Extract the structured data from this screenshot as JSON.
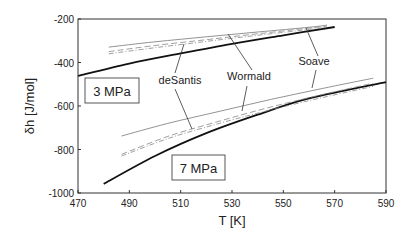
{
  "chart_data": {
    "type": "line",
    "title": "",
    "xlabel": "T [K]",
    "ylabel": "δh [J/mol]",
    "xlim": [
      470,
      590
    ],
    "ylim": [
      -1000,
      -200
    ],
    "xticks": [
      470,
      490,
      510,
      530,
      550,
      570,
      590
    ],
    "yticks": [
      -200,
      -400,
      -600,
      -800,
      -1000
    ],
    "grid": false,
    "legend": "none (inline labels with leader lines)",
    "groups": [
      {
        "label": "3 MPa",
        "series": [
          {
            "name": "reference (thick)",
            "style": "thick-solid",
            "x": [
              470,
              490,
              510,
              530,
              550,
              570
            ],
            "y": [
              -462,
              -405,
              -358,
              -314,
              -275,
              -237
            ]
          },
          {
            "name": "Wormald",
            "style": "thin-solid",
            "x": [
              482,
              500,
              520,
              540,
              560,
              567
            ],
            "y": [
              -329,
              -305,
              -282,
              -260,
              -238,
              -228
            ]
          },
          {
            "name": "Soave",
            "style": "dashed",
            "x": [
              482,
              500,
              520,
              540,
              560,
              567
            ],
            "y": [
              -350,
              -322,
              -295,
              -268,
              -242,
              -233
            ]
          },
          {
            "name": "deSantis",
            "style": "dash-dot",
            "x": [
              482,
              500,
              520,
              540,
              560,
              567
            ],
            "y": [
              -360,
              -332,
              -303,
              -275,
              -248,
              -238
            ]
          }
        ]
      },
      {
        "label": "7 MPa",
        "series": [
          {
            "name": "reference (thick)",
            "style": "thick-solid",
            "x": [
              480,
              500,
              520,
              540,
              560,
              590
            ],
            "y": [
              -958,
              -830,
              -725,
              -640,
              -565,
              -490
            ]
          },
          {
            "name": "Wormald",
            "style": "thin-solid",
            "x": [
              487,
              505,
              525,
              545,
              565,
              585
            ],
            "y": [
              -738,
              -680,
              -625,
              -570,
              -520,
              -472
            ]
          },
          {
            "name": "Soave",
            "style": "dashed",
            "x": [
              487,
              505,
              525,
              545,
              565,
              585
            ],
            "y": [
              -822,
              -740,
              -670,
              -605,
              -548,
              -495
            ]
          },
          {
            "name": "deSantis",
            "style": "dash-dot",
            "x": [
              487,
              505,
              525,
              545,
              565,
              585
            ],
            "y": [
              -830,
              -750,
              -680,
              -618,
              -562,
              -510
            ]
          }
        ]
      }
    ],
    "annotations": [
      {
        "text": "deSantis",
        "x": 180,
        "y": 84,
        "leaders": [
          [
            175,
            73,
            184,
            44
          ],
          [
            175,
            89,
            192,
            129
          ]
        ]
      },
      {
        "text": "Wormald",
        "x": 249,
        "y": 80,
        "leaders": [
          [
            252,
            70,
            228,
            34
          ],
          [
            247,
            86,
            242,
            111
          ]
        ]
      },
      {
        "text": "Soave",
        "x": 314,
        "y": 65,
        "leaders": [
          [
            318,
            56,
            306,
            28
          ],
          [
            316,
            70,
            312,
            88
          ]
        ]
      }
    ],
    "boxes": [
      {
        "text": "3 MPa",
        "x": 85,
        "y": 78,
        "w": 54,
        "h": 25
      },
      {
        "text": "7 MPa",
        "x": 172,
        "y": 155,
        "w": 53,
        "h": 25
      }
    ]
  }
}
